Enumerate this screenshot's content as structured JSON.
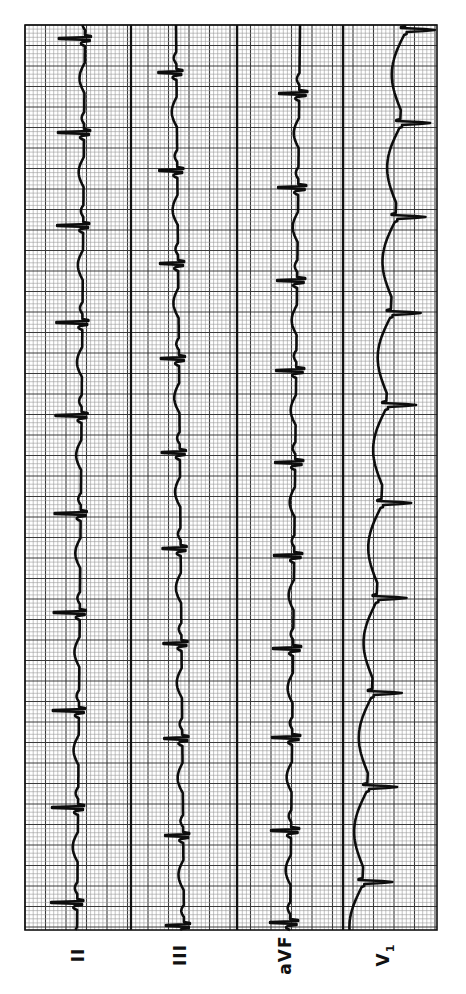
{
  "chart_data": {
    "type": "line",
    "title": "",
    "orientation": "vertical-time-axis",
    "grid": {
      "small_box_px": 4.1,
      "large_box_px": 20.6,
      "on": true
    },
    "plot_area": {
      "x0": 25,
      "y0": 25,
      "x1": 437,
      "y1": 930
    },
    "strip_dividers_x": [
      131,
      237,
      343
    ],
    "leads": [
      {
        "name": "II",
        "label": "II",
        "sub": "",
        "label_x": 78,
        "baseline_x": 85,
        "baseline_drift": -8,
        "r_amp": -26,
        "s_amp": 6,
        "morph": "qrs_left",
        "beats_y": [
          38,
          132,
          225,
          322,
          415,
          513,
          612,
          710,
          807,
          902
        ]
      },
      {
        "name": "III",
        "label": "III",
        "sub": "",
        "label_x": 180,
        "baseline_x": 176,
        "baseline_drift": 8,
        "r_amp": -18,
        "s_amp": 6,
        "morph": "qrs_left",
        "beats_y": [
          72,
          170,
          263,
          358,
          452,
          548,
          643,
          738,
          835,
          925
        ]
      },
      {
        "name": "aVF",
        "label": "aVF",
        "sub": "",
        "label_x": 285,
        "baseline_x": 300,
        "baseline_drift": -10,
        "r_amp": -20,
        "s_amp": 8,
        "morph": "qrs_left",
        "beats_y": [
          93,
          187,
          280,
          370,
          462,
          555,
          648,
          737,
          830,
          922
        ]
      },
      {
        "name": "V1",
        "label": "V",
        "sub": "1",
        "label_x": 385,
        "baseline_x": 405,
        "baseline_drift": -45,
        "r_amp": -4,
        "s_amp": 30,
        "morph": "deep_s",
        "beats_y": [
          30,
          123,
          217,
          313,
          405,
          503,
          598,
          693,
          787,
          882
        ]
      }
    ],
    "xlabel": "",
    "ylabel": "",
    "heart_rate_note": "RR interval approx 94-97 px (~23 small boxes)"
  },
  "labels": {
    "lead_ii": "II",
    "lead_iii": "III",
    "lead_avf": "aVF",
    "lead_v1_main": "V",
    "lead_v1_sub": "1"
  },
  "colors": {
    "paper": "#ffffff",
    "grid_small": "#9a9a9a",
    "grid_large": "#3a3a3a",
    "divider": "#111111",
    "trace": "#0d0d0d"
  }
}
